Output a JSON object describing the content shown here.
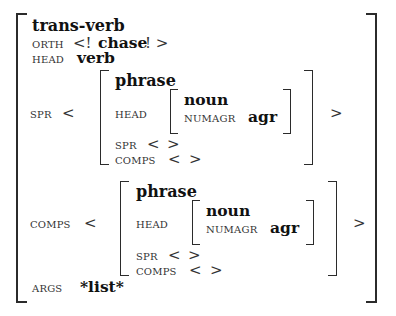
{
  "figure": {
    "kind": "attribute-value-matrix"
  },
  "outer": {
    "type_label": "trans-verb",
    "orth": {
      "attr": "ORTH",
      "open_delim": "<!",
      "value": "chase",
      "close_delim": "! >"
    },
    "head": {
      "attr": "HEAD",
      "value": "verb"
    },
    "spr": {
      "attr": "SPR",
      "open_angle": "<",
      "close_angle": ">",
      "item": {
        "type_label": "phrase",
        "head": {
          "attr": "HEAD",
          "inner": {
            "type_label": "noun",
            "numagr_attr": "NUMAGR",
            "numagr_value": "agr"
          }
        },
        "spr": {
          "attr": "SPR",
          "open_angle": "<",
          "close_angle": ">"
        },
        "comps": {
          "attr": "COMPS",
          "open_angle": "<",
          "close_angle": ">"
        }
      }
    },
    "comps": {
      "attr": "COMPS",
      "open_angle": "<",
      "close_angle": ">",
      "item": {
        "type_label": "phrase",
        "head": {
          "attr": "HEAD",
          "inner": {
            "type_label": "noun",
            "numagr_attr": "NUMAGR",
            "numagr_value": "agr"
          }
        },
        "spr": {
          "attr": "SPR",
          "open_angle": "<",
          "close_angle": ">"
        },
        "comps": {
          "attr": "COMPS",
          "open_angle": "<",
          "close_angle": ">"
        }
      }
    },
    "args": {
      "attr": "ARGS",
      "value": "*list*"
    }
  },
  "colors": {
    "ink": "#1a1a1a",
    "bracket": "#2b2b2b",
    "background": "#ffffff"
  }
}
